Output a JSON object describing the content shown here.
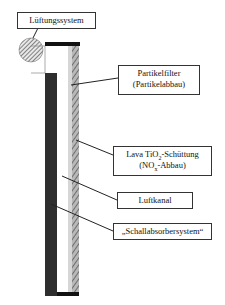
{
  "diagram": {
    "labels": {
      "ventilation": {
        "text": "Lüftungssystem"
      },
      "particle_filter": {
        "line1": "Partikelfilter",
        "line2": "(Partikelabbau)"
      },
      "lava": {
        "line1_pre": "Lava TiO",
        "line1_sub": "2",
        "line1_post": "-Schüttung",
        "line2_pre": "(NO",
        "line2_sub": "x",
        "line2_post": "-Abbau)"
      },
      "air_channel": {
        "text": "Luftkanal"
      },
      "sound_absorber": {
        "text": "„Schallabsorbersystem“"
      }
    },
    "colors": {
      "wall": "#2e2e2e",
      "bar": "#111111",
      "channel": "#ffffff",
      "gray_strip": "#d6d6d6",
      "hatch": "#6a6a6a",
      "leader": "#222222"
    }
  }
}
